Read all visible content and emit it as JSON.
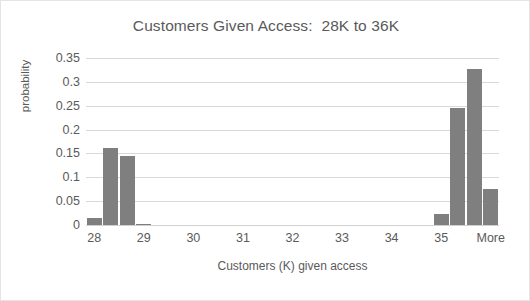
{
  "chart_data": {
    "type": "bar",
    "title": "Customers Given Access:  28K to 36K",
    "xlabel": "Customers (K) given access",
    "ylabel": "probability",
    "categories": [
      "28",
      "29",
      "30",
      "31",
      "32",
      "33",
      "34",
      "35",
      "More"
    ],
    "xtick_labels": [
      "28",
      "29",
      "30",
      "31",
      "32",
      "33",
      "34",
      "35",
      "More"
    ],
    "ytick_labels": [
      "0",
      "0.05",
      "0.1",
      "0.15",
      "0.2",
      "0.25",
      "0.3",
      "0.35"
    ],
    "ytick_values": [
      0,
      0.05,
      0.1,
      0.15,
      0.2,
      0.25,
      0.3,
      0.35
    ],
    "ylim": [
      0,
      0.35
    ],
    "grid": "horizontal",
    "legend": "none",
    "bar_color": "#7f7f7f",
    "gridline_color": "#d9d9d9",
    "text_color": "#5a5a5a",
    "border_color": "#e4e4e4",
    "bins": [
      {
        "index": 0,
        "label": "28",
        "value": 0.015
      },
      {
        "index": 1,
        "label": "",
        "value": 0.161
      },
      {
        "index": 2,
        "label": "",
        "value": 0.145
      },
      {
        "index": 3,
        "label": "29",
        "value": 0.003
      },
      {
        "index": 4,
        "label": "",
        "value": 0
      },
      {
        "index": 5,
        "label": "",
        "value": 0
      },
      {
        "index": 6,
        "label": "30",
        "value": 0
      },
      {
        "index": 7,
        "label": "",
        "value": 0
      },
      {
        "index": 8,
        "label": "",
        "value": 0
      },
      {
        "index": 9,
        "label": "31",
        "value": 0
      },
      {
        "index": 10,
        "label": "",
        "value": 0
      },
      {
        "index": 11,
        "label": "",
        "value": 0
      },
      {
        "index": 12,
        "label": "32",
        "value": 0
      },
      {
        "index": 13,
        "label": "",
        "value": 0
      },
      {
        "index": 14,
        "label": "",
        "value": 0
      },
      {
        "index": 15,
        "label": "33",
        "value": 0
      },
      {
        "index": 16,
        "label": "",
        "value": 0
      },
      {
        "index": 17,
        "label": "",
        "value": 0
      },
      {
        "index": 18,
        "label": "34",
        "value": 0
      },
      {
        "index": 19,
        "label": "",
        "value": 0
      },
      {
        "index": 20,
        "label": "",
        "value": 0
      },
      {
        "index": 21,
        "label": "35",
        "value": 0.024
      },
      {
        "index": 22,
        "label": "",
        "value": 0.245
      },
      {
        "index": 23,
        "label": "",
        "value": 0.327
      },
      {
        "index": 24,
        "label": "More",
        "value": 0.075
      }
    ],
    "xtick_positions": [
      0,
      3,
      6,
      9,
      12,
      15,
      18,
      21,
      24
    ]
  }
}
